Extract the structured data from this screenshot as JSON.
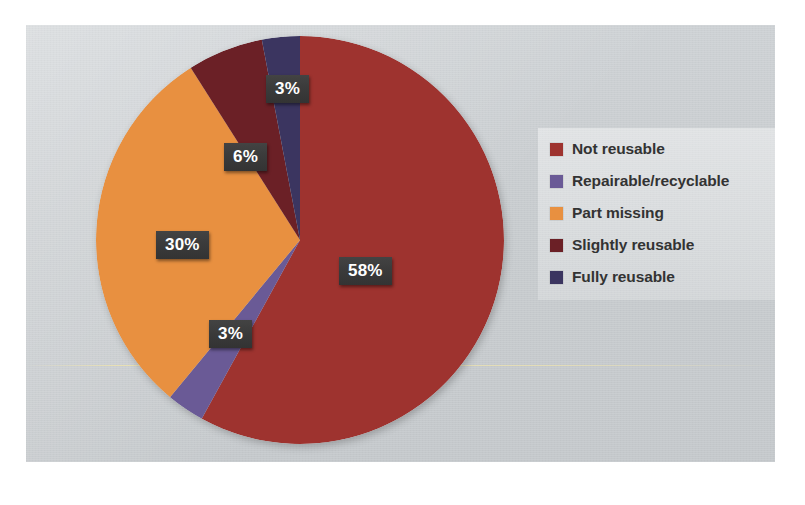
{
  "chart_data": {
    "type": "pie",
    "title": "",
    "subtitle": "",
    "xlabel": "",
    "ylabel": "",
    "legend_position": "right",
    "grid": false,
    "units": "percent",
    "total": 100,
    "categories": [
      "Not reusable",
      "Repairable/recyclable",
      "Part missing",
      "Slightly reusable",
      "Fully reusable"
    ],
    "values": [
      58,
      3,
      30,
      6,
      3
    ],
    "data_labels": [
      "58%",
      "3%",
      "30%",
      "6%",
      "3%"
    ],
    "colors": [
      "#9E332F",
      "#6A5A96",
      "#E89040",
      "#6B2026",
      "#3B3560"
    ],
    "slices": [
      {
        "label": "Not reusable",
        "value": 58,
        "display": "58%",
        "color": "#9E332F",
        "start_deg": 0,
        "end_deg": 208.8
      },
      {
        "label": "Repairable/recyclable",
        "value": 3,
        "display": "3%",
        "color": "#6A5A96",
        "start_deg": 208.8,
        "end_deg": 219.6
      },
      {
        "label": "Part missing",
        "value": 30,
        "display": "30%",
        "color": "#E89040",
        "start_deg": 219.6,
        "end_deg": 327.6
      },
      {
        "label": "Slightly reusable",
        "value": 6,
        "display": "6%",
        "color": "#6B2026",
        "start_deg": 327.6,
        "end_deg": 349.2
      },
      {
        "label": "Fully reusable",
        "value": 3,
        "display": "3%",
        "color": "#3B3560",
        "start_deg": 349.2,
        "end_deg": 360
      }
    ]
  },
  "labels": {
    "not_reusable": "58%",
    "repairable": "3%",
    "part_missing": "30%",
    "slightly_reusable": "6%",
    "fully_reusable": "3%"
  },
  "legend": {
    "items": [
      {
        "label": "Not reusable",
        "color": "#9E332F"
      },
      {
        "label": "Repairable/recyclable",
        "color": "#6A5A96"
      },
      {
        "label": "Part missing",
        "color": "#E89040"
      },
      {
        "label": "Slightly reusable",
        "color": "#6B2026"
      },
      {
        "label": "Fully reusable",
        "color": "#3B3560"
      }
    ]
  },
  "theme": {
    "panel_background": "#C8CCCF",
    "page_background": "#FFFFFF",
    "label_box_background": "#3A3A3A",
    "label_text_color": "#FFFFFF",
    "legend_text_color": "#333333"
  }
}
